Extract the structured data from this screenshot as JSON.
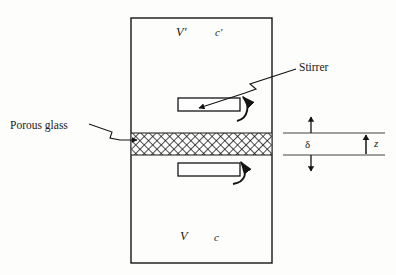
{
  "figure": {
    "name": "diffusion-cell-diagram",
    "background_color": "#fdfdfb",
    "line_color": "#1a1a1a"
  },
  "labels": {
    "stirrer": "Stirrer",
    "porous_glass": "Porous glass",
    "upper_volume": "V′",
    "upper_concentration": "c′",
    "lower_volume": "V",
    "lower_concentration": "c",
    "membrane_thickness": "δ",
    "axis_z": "z"
  },
  "cell": {
    "left": 131,
    "top": 18,
    "right": 272,
    "bottom": 263,
    "border_width": 1.4
  },
  "membrane": {
    "top": 133,
    "bottom": 155,
    "pattern": "cross-hatch",
    "hatch_spacing": 6
  },
  "stirrers": [
    {
      "name": "upper-stirrer",
      "x": 178,
      "y": 98,
      "width": 62,
      "height": 13,
      "rotation_arrow": "clockwise"
    },
    {
      "name": "lower-stirrer",
      "x": 178,
      "y": 163,
      "width": 62,
      "height": 13,
      "rotation_arrow": "counter-clockwise"
    }
  ],
  "annotations": {
    "delta_guides": {
      "x_start": 283,
      "x_end": 385,
      "y_top": 133,
      "y_bottom": 155
    },
    "delta_arrow_x": 311,
    "z_arrow_x": 366
  }
}
